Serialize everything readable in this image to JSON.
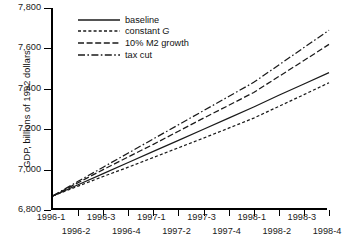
{
  "chart_data": {
    "type": "line",
    "title": "",
    "xlabel": "",
    "ylabel": "GDP, billions of 1992 dollars",
    "ylim": [
      6800,
      7800
    ],
    "yticks": [
      6800,
      7000,
      7200,
      7400,
      7600,
      7800
    ],
    "ytick_labels": [
      "6,800",
      "7,000",
      "7,200",
      "7,400",
      "7,600",
      "7,800"
    ],
    "grid": false,
    "legend_position": "upper-left",
    "categories": [
      "1996-1",
      "1996-2",
      "1996-3",
      "1996-4",
      "1997-1",
      "1997-2",
      "1997-3",
      "1997-4",
      "1998-1",
      "1998-2",
      "1998-3",
      "1998-4"
    ],
    "series": [
      {
        "name": "baseline",
        "style": "solid",
        "values": [
          6870,
          6925,
          6980,
          7035,
          7090,
          7145,
          7200,
          7255,
          7310,
          7368,
          7424,
          7480
        ]
      },
      {
        "name": "constant G",
        "style": "dotted",
        "values": [
          6870,
          6918,
          6966,
          7012,
          7060,
          7108,
          7156,
          7205,
          7255,
          7313,
          7371,
          7430
        ]
      },
      {
        "name": "10% M2 growth",
        "style": "dashed",
        "values": [
          6870,
          6935,
          7000,
          7063,
          7125,
          7190,
          7255,
          7318,
          7382,
          7461,
          7540,
          7620
        ]
      },
      {
        "name": "tax cut",
        "style": "dash-dot",
        "values": [
          6870,
          6942,
          7012,
          7082,
          7152,
          7222,
          7292,
          7362,
          7432,
          7518,
          7604,
          7690
        ]
      }
    ]
  },
  "legend": {
    "items": [
      {
        "label": "baseline",
        "style": "solid",
        "italic_tail": ""
      },
      {
        "label": "constant ",
        "style": "dotted",
        "italic_tail": "G"
      },
      {
        "label": "10% M2 growth",
        "style": "dashed",
        "italic_tail": ""
      },
      {
        "label": "tax cut",
        "style": "dash-dot",
        "italic_tail": ""
      }
    ]
  },
  "colors": {
    "line": "#1a1a1a",
    "axis": "#000000",
    "background": "#ffffff"
  }
}
